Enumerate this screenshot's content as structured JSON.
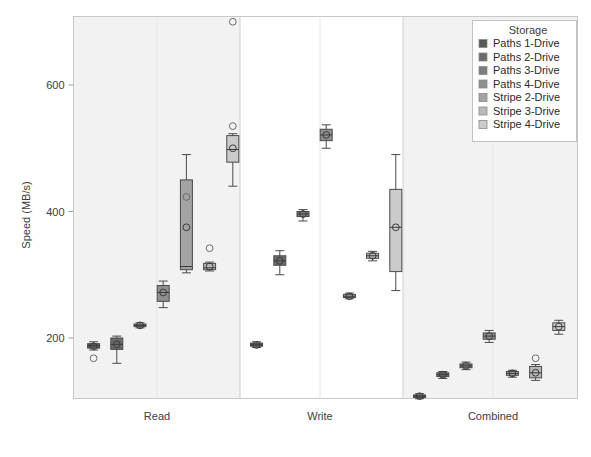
{
  "chart_data": {
    "type": "box",
    "title": "",
    "xlabel": "",
    "ylabel": "Speed (MB/s)",
    "ylim": [
      100,
      720
    ],
    "yticks": [
      200,
      400,
      600
    ],
    "ytick_labels": [
      "200",
      "400",
      "600"
    ],
    "categories": [
      "Read",
      "Write",
      "Combined"
    ],
    "grid": false,
    "legend_position": "top-right",
    "legend_title": "Storage",
    "series": [
      {
        "name": "Paths 1-Drive",
        "color": "#585858"
      },
      {
        "name": "Paths 2-Drive",
        "color": "#6b6b6b"
      },
      {
        "name": "Paths 3-Drive",
        "color": "#7d7d7d"
      },
      {
        "name": "Paths 4-Drive",
        "color": "#8f8f8f"
      },
      {
        "name": "Stripe 2-Drive",
        "color": "#a3a3a3"
      },
      {
        "name": "Stripe 3-Drive",
        "color": "#b8b8b8"
      },
      {
        "name": "Stripe 4-Drive",
        "color": "#cbcbcb"
      }
    ],
    "boxes": [
      {
        "category": "Read",
        "series": "Paths 1-Drive",
        "whisker_low": 181,
        "q1": 184,
        "median": 188,
        "q3": 191,
        "whisker_high": 194,
        "mean": 187,
        "outliers": [
          168
        ]
      },
      {
        "category": "Read",
        "series": "Paths 2-Drive",
        "whisker_low": 160,
        "q1": 182,
        "median": 190,
        "q3": 200,
        "whisker_high": 203,
        "mean": 190,
        "outliers": []
      },
      {
        "category": "Read",
        "series": "Paths 3-Drive",
        "whisker_low": 216,
        "q1": 218,
        "median": 220,
        "q3": 222,
        "whisker_high": 224,
        "mean": 220,
        "outliers": []
      },
      {
        "category": "Read",
        "series": "Paths 4-Drive",
        "whisker_low": 248,
        "q1": 258,
        "median": 272,
        "q3": 283,
        "whisker_high": 290,
        "mean": 272,
        "outliers": []
      },
      {
        "category": "Read",
        "series": "Stripe 2-Drive",
        "whisker_low": 303,
        "q1": 308,
        "median": 313,
        "q3": 450,
        "whisker_high": 490,
        "mean": 375,
        "outliers": [
          423
        ]
      },
      {
        "category": "Read",
        "series": "Stripe 3-Drive",
        "whisker_low": 306,
        "q1": 308,
        "median": 311,
        "q3": 318,
        "whisker_high": 320,
        "mean": 313,
        "outliers": [
          342
        ]
      },
      {
        "category": "Read",
        "series": "Stripe 4-Drive",
        "whisker_low": 440,
        "q1": 478,
        "median": 498,
        "q3": 520,
        "whisker_high": 523,
        "mean": 500,
        "outliers": [
          535,
          700
        ]
      }
    ],
    "boxes_write": [
      {
        "category": "Write",
        "series": "Paths 1-Drive",
        "whisker_low": 185,
        "q1": 187,
        "median": 189,
        "q3": 192,
        "whisker_high": 194,
        "mean": 189,
        "outliers": []
      },
      {
        "category": "Write",
        "series": "Paths 2-Drive",
        "whisker_low": 300,
        "q1": 315,
        "median": 322,
        "q3": 330,
        "whisker_high": 338,
        "mean": 322,
        "outliers": []
      },
      {
        "category": "Write",
        "series": "Paths 3-Drive",
        "whisker_low": 385,
        "q1": 392,
        "median": 396,
        "q3": 400,
        "whisker_high": 403,
        "mean": 396,
        "outliers": []
      },
      {
        "category": "Write",
        "series": "Paths 4-Drive",
        "whisker_low": 500,
        "q1": 512,
        "median": 521,
        "q3": 530,
        "whisker_high": 537,
        "mean": 521,
        "outliers": []
      },
      {
        "category": "Write",
        "series": "Stripe 2-Drive",
        "whisker_low": 262,
        "q1": 264,
        "median": 266,
        "q3": 269,
        "whisker_high": 271,
        "mean": 266,
        "outliers": []
      },
      {
        "category": "Write",
        "series": "Stripe 3-Drive",
        "whisker_low": 322,
        "q1": 326,
        "median": 330,
        "q3": 334,
        "whisker_high": 337,
        "mean": 330,
        "outliers": []
      },
      {
        "category": "Write",
        "series": "Stripe 4-Drive",
        "whisker_low": 275,
        "q1": 305,
        "median": 375,
        "q3": 435,
        "whisker_high": 490,
        "mean": 375,
        "outliers": []
      }
    ],
    "boxes_combined": [
      {
        "category": "Combined",
        "series": "Paths 1-Drive",
        "whisker_low": 104,
        "q1": 106,
        "median": 108,
        "q3": 110,
        "whisker_high": 112,
        "mean": 108,
        "outliers": []
      },
      {
        "category": "Combined",
        "series": "Paths 2-Drive",
        "whisker_low": 136,
        "q1": 139,
        "median": 142,
        "q3": 145,
        "whisker_high": 147,
        "mean": 142,
        "outliers": []
      },
      {
        "category": "Combined",
        "series": "Paths 3-Drive",
        "whisker_low": 150,
        "q1": 153,
        "median": 156,
        "q3": 159,
        "whisker_high": 162,
        "mean": 156,
        "outliers": []
      },
      {
        "category": "Combined",
        "series": "Paths 4-Drive",
        "whisker_low": 193,
        "q1": 198,
        "median": 203,
        "q3": 208,
        "whisker_high": 212,
        "mean": 203,
        "outliers": []
      },
      {
        "category": "Combined",
        "series": "Stripe 2-Drive",
        "whisker_low": 138,
        "q1": 141,
        "median": 144,
        "q3": 147,
        "whisker_high": 149,
        "mean": 144,
        "outliers": []
      },
      {
        "category": "Combined",
        "series": "Stripe 3-Drive",
        "whisker_low": 133,
        "q1": 137,
        "median": 145,
        "q3": 155,
        "whisker_high": 158,
        "mean": 145,
        "outliers": [
          168
        ]
      },
      {
        "category": "Combined",
        "series": "Stripe 4-Drive",
        "whisker_low": 206,
        "q1": 212,
        "median": 218,
        "q3": 224,
        "whisker_high": 228,
        "mean": 218,
        "outliers": []
      }
    ]
  },
  "axis": {
    "y_title": "Speed (MB/s)",
    "y_ticks": [
      "200",
      "400",
      "600"
    ],
    "x_categories": [
      "Read",
      "Write",
      "Combined"
    ]
  },
  "legend": {
    "title": "Storage",
    "items": [
      {
        "label": "Paths 1-Drive"
      },
      {
        "label": "Paths 2-Drive"
      },
      {
        "label": "Paths 3-Drive"
      },
      {
        "label": "Paths 4-Drive"
      },
      {
        "label": "Stripe 2-Drive"
      },
      {
        "label": "Stripe 3-Drive"
      },
      {
        "label": "Stripe 4-Drive"
      }
    ]
  }
}
